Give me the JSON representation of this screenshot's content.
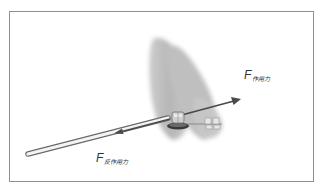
{
  "diagram": {
    "labels": {
      "action_force": {
        "symbol": "F",
        "subscript": "作用力"
      },
      "reaction_force": {
        "symbol": "F",
        "subscript": "反作用力"
      }
    },
    "elements": {
      "tooth": "tooth-silhouette",
      "bracket": "orthodontic-bracket",
      "wire": "archwire",
      "action_arrow": "arrow-up-right",
      "reaction_arrow": "arrow-down-left",
      "rod": "elastic-rod"
    },
    "colors": {
      "arrow": "#4a4a4a",
      "tooth": "#b8b8b8",
      "frame": "#8f8f8f",
      "rod_outline": "#6a6a6a",
      "rod_fill": "#f4f4f4"
    }
  }
}
